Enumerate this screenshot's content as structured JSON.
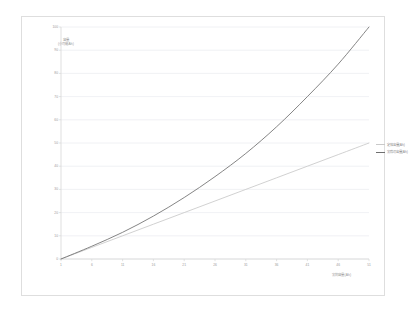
{
  "chart_data": {
    "type": "line",
    "title": "",
    "xlabel": "実効容量(Ah)",
    "ylabel": "容量\n(小可能Ah)",
    "xlim": [
      1,
      51
    ],
    "ylim": [
      0,
      100
    ],
    "grid": true,
    "legend_position": "right",
    "x_ticks": [
      1,
      6,
      11,
      16,
      21,
      26,
      31,
      36,
      41,
      46,
      51
    ],
    "y_ticks": [
      0,
      10,
      20,
      30,
      40,
      50,
      60,
      70,
      80,
      90,
      100
    ],
    "x": [
      1,
      6,
      11,
      16,
      21,
      26,
      31,
      36,
      41,
      46,
      51
    ],
    "series": [
      {
        "name": "定格容量(Ah)",
        "color": "#c9c9c9",
        "values": [
          0,
          5,
          10,
          15,
          20,
          25,
          30,
          35,
          40,
          45,
          50
        ]
      },
      {
        "name": "実際の容量(Ah)",
        "color": "#6f6f6f",
        "values": [
          0,
          5.5,
          11.5,
          18.5,
          26.5,
          35.5,
          45.5,
          57,
          70,
          84,
          100
        ]
      }
    ]
  },
  "axis": {
    "grid_color": "#eceef1",
    "axis_line_color": "#d7d7d7",
    "tick_color": "#9a9a9a"
  },
  "frame": {
    "border_color": "#dedede",
    "background": "#ffffff"
  }
}
